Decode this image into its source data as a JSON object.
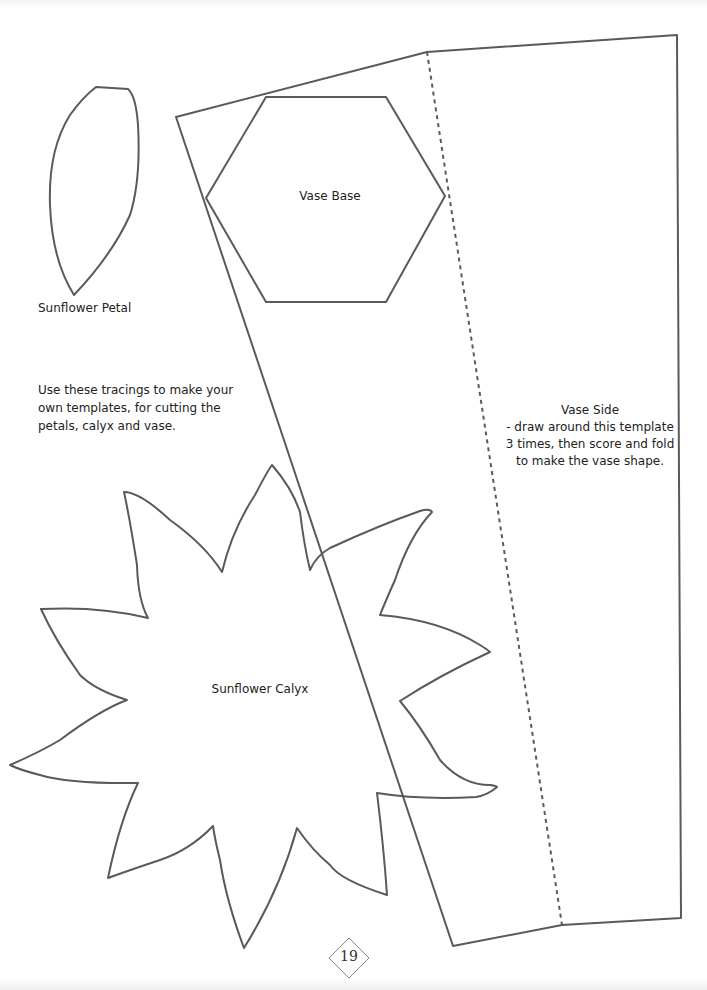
{
  "page": {
    "number": "19",
    "stroke_color": "#555555"
  },
  "labels": {
    "petal": "Sunflower Petal",
    "vase_base": "Vase Base",
    "calyx": "Sunflower Calyx",
    "instructions": [
      "Use these tracings to make your",
      "own templates, for cutting the",
      "petals, calyx and vase."
    ],
    "vase_side": [
      "Vase Side",
      "- draw around this template",
      "3 times, then score and fold",
      "to make the vase shape."
    ]
  }
}
